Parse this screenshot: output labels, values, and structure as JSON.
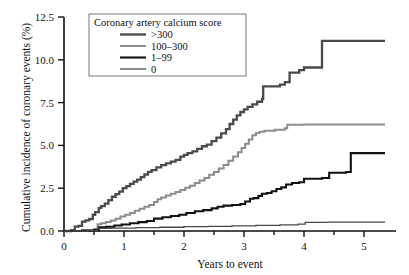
{
  "chart_data": {
    "type": "line",
    "title": "",
    "xlabel": "Years to event",
    "ylabel": "Cumulative incidence of coronary events (%)",
    "xlim": [
      0,
      5.4
    ],
    "ylim": [
      0,
      12.5
    ],
    "xticks": [
      "0",
      "1",
      "2",
      "3",
      "4",
      "5"
    ],
    "xtick_values": [
      0,
      1,
      2,
      3,
      4,
      5
    ],
    "yticks": [
      "0.0",
      "2.5",
      "5.0",
      "7.5",
      "10.0",
      "12.5"
    ],
    "ytick_values": [
      0,
      2.5,
      5.0,
      7.5,
      10.0,
      12.5
    ],
    "grid": false,
    "legend_position": "upper-left-inside",
    "legend_title": "Coronary artery calcium score",
    "series": [
      {
        "name": ">300",
        "color": "#4a4a4a",
        "width": 2.3,
        "points": [
          [
            0.0,
            0.0
          ],
          [
            0.12,
            0.05
          ],
          [
            0.18,
            0.25
          ],
          [
            0.24,
            0.3
          ],
          [
            0.3,
            0.55
          ],
          [
            0.36,
            0.62
          ],
          [
            0.42,
            0.7
          ],
          [
            0.48,
            0.95
          ],
          [
            0.52,
            1.1
          ],
          [
            0.58,
            1.35
          ],
          [
            0.62,
            1.45
          ],
          [
            0.68,
            1.6
          ],
          [
            0.74,
            1.8
          ],
          [
            0.8,
            2.0
          ],
          [
            0.86,
            2.15
          ],
          [
            0.92,
            2.3
          ],
          [
            0.98,
            2.5
          ],
          [
            1.04,
            2.62
          ],
          [
            1.1,
            2.75
          ],
          [
            1.16,
            2.88
          ],
          [
            1.22,
            3.0
          ],
          [
            1.28,
            3.15
          ],
          [
            1.34,
            3.3
          ],
          [
            1.4,
            3.45
          ],
          [
            1.46,
            3.55
          ],
          [
            1.54,
            3.72
          ],
          [
            1.62,
            3.85
          ],
          [
            1.7,
            3.95
          ],
          [
            1.78,
            4.05
          ],
          [
            1.86,
            4.15
          ],
          [
            1.94,
            4.35
          ],
          [
            2.0,
            4.45
          ],
          [
            2.06,
            4.55
          ],
          [
            2.14,
            4.65
          ],
          [
            2.22,
            4.8
          ],
          [
            2.3,
            4.95
          ],
          [
            2.38,
            5.05
          ],
          [
            2.46,
            5.25
          ],
          [
            2.54,
            5.45
          ],
          [
            2.62,
            5.7
          ],
          [
            2.7,
            5.95
          ],
          [
            2.76,
            6.25
          ],
          [
            2.82,
            6.5
          ],
          [
            2.88,
            6.75
          ],
          [
            2.94,
            6.95
          ],
          [
            3.0,
            7.1
          ],
          [
            3.06,
            7.25
          ],
          [
            3.14,
            7.4
          ],
          [
            3.22,
            7.55
          ],
          [
            3.3,
            7.7
          ],
          [
            3.32,
            8.45
          ],
          [
            3.6,
            8.55
          ],
          [
            3.68,
            8.7
          ],
          [
            3.76,
            9.25
          ],
          [
            3.92,
            9.4
          ],
          [
            4.0,
            9.55
          ],
          [
            4.3,
            11.1
          ],
          [
            5.35,
            11.1
          ]
        ]
      },
      {
        "name": "100–300",
        "color": "#8c8c8c",
        "width": 2.0,
        "points": [
          [
            0.0,
            0.0
          ],
          [
            0.3,
            0.05
          ],
          [
            0.5,
            0.12
          ],
          [
            0.56,
            0.4
          ],
          [
            0.62,
            0.45
          ],
          [
            0.7,
            0.52
          ],
          [
            0.78,
            0.62
          ],
          [
            0.86,
            0.72
          ],
          [
            0.94,
            0.85
          ],
          [
            1.02,
            0.95
          ],
          [
            1.1,
            1.05
          ],
          [
            1.18,
            1.18
          ],
          [
            1.26,
            1.3
          ],
          [
            1.34,
            1.42
          ],
          [
            1.42,
            1.52
          ],
          [
            1.5,
            1.7
          ],
          [
            1.56,
            1.85
          ],
          [
            1.62,
            1.95
          ],
          [
            1.7,
            2.08
          ],
          [
            1.78,
            2.18
          ],
          [
            1.86,
            2.28
          ],
          [
            1.94,
            2.4
          ],
          [
            2.02,
            2.52
          ],
          [
            2.1,
            2.65
          ],
          [
            2.18,
            2.8
          ],
          [
            2.26,
            2.95
          ],
          [
            2.34,
            3.1
          ],
          [
            2.42,
            3.28
          ],
          [
            2.5,
            3.45
          ],
          [
            2.58,
            3.65
          ],
          [
            2.66,
            3.85
          ],
          [
            2.74,
            4.1
          ],
          [
            2.82,
            4.35
          ],
          [
            2.9,
            4.6
          ],
          [
            2.96,
            4.85
          ],
          [
            3.02,
            5.1
          ],
          [
            3.08,
            5.35
          ],
          [
            3.14,
            5.6
          ],
          [
            3.2,
            5.72
          ],
          [
            3.26,
            5.8
          ],
          [
            3.34,
            5.85
          ],
          [
            3.52,
            5.92
          ],
          [
            3.68,
            6.0
          ],
          [
            3.72,
            6.2
          ],
          [
            4.0,
            6.22
          ],
          [
            5.35,
            6.22
          ]
        ]
      },
      {
        "name": "1–99",
        "color": "#111111",
        "width": 2.1,
        "points": [
          [
            0.0,
            0.0
          ],
          [
            0.3,
            0.02
          ],
          [
            0.5,
            0.05
          ],
          [
            0.58,
            0.22
          ],
          [
            0.7,
            0.25
          ],
          [
            0.84,
            0.32
          ],
          [
            0.96,
            0.38
          ],
          [
            1.1,
            0.45
          ],
          [
            1.24,
            0.52
          ],
          [
            1.38,
            0.58
          ],
          [
            1.5,
            0.72
          ],
          [
            1.64,
            0.8
          ],
          [
            1.78,
            0.88
          ],
          [
            1.92,
            0.95
          ],
          [
            2.04,
            1.05
          ],
          [
            2.18,
            1.15
          ],
          [
            2.32,
            1.22
          ],
          [
            2.46,
            1.32
          ],
          [
            2.56,
            1.42
          ],
          [
            2.66,
            1.48
          ],
          [
            2.8,
            1.52
          ],
          [
            2.94,
            1.58
          ],
          [
            3.02,
            1.72
          ],
          [
            3.1,
            1.88
          ],
          [
            3.16,
            1.92
          ],
          [
            3.24,
            2.05
          ],
          [
            3.3,
            2.18
          ],
          [
            3.38,
            2.22
          ],
          [
            3.46,
            2.32
          ],
          [
            3.54,
            2.45
          ],
          [
            3.62,
            2.55
          ],
          [
            3.7,
            2.72
          ],
          [
            3.8,
            2.8
          ],
          [
            3.92,
            2.85
          ],
          [
            4.0,
            3.05
          ],
          [
            4.3,
            3.1
          ],
          [
            4.42,
            3.4
          ],
          [
            4.7,
            3.45
          ],
          [
            4.78,
            4.55
          ],
          [
            5.35,
            4.55
          ]
        ]
      },
      {
        "name": "0",
        "color": "#4a4a4a",
        "width": 1.3,
        "points": [
          [
            0.0,
            0.0
          ],
          [
            0.4,
            0.02
          ],
          [
            0.56,
            0.15
          ],
          [
            0.8,
            0.17
          ],
          [
            1.2,
            0.2
          ],
          [
            1.6,
            0.22
          ],
          [
            2.0,
            0.25
          ],
          [
            2.4,
            0.27
          ],
          [
            2.8,
            0.3
          ],
          [
            3.2,
            0.33
          ],
          [
            3.6,
            0.36
          ],
          [
            3.9,
            0.4
          ],
          [
            4.02,
            0.5
          ],
          [
            4.4,
            0.52
          ],
          [
            5.0,
            0.52
          ],
          [
            5.35,
            0.52
          ]
        ]
      }
    ]
  },
  "legend": {
    "title": "Coronary artery calcium score",
    "items": [
      {
        "label": ">300"
      },
      {
        "label": "100–300"
      },
      {
        "label": "1–99"
      },
      {
        "label": "0"
      }
    ]
  },
  "axes": {
    "x_title": "Years to event",
    "y_title": "Cumulative  incidence of coronary events (%)"
  }
}
